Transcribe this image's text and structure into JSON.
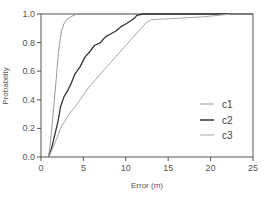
{
  "chart_data": {
    "type": "line",
    "title": "",
    "xlabel": "Error (m)",
    "ylabel": "Probability",
    "xlim": [
      0,
      25
    ],
    "ylim": [
      0,
      1.0
    ],
    "xticks": [
      "0",
      "5",
      "10",
      "15",
      "20",
      "25"
    ],
    "yticks": [
      "0.0",
      "0.2",
      "0.4",
      "0.6",
      "0.8",
      "1.0"
    ],
    "grid": false,
    "legend_position": "lower right",
    "series": [
      {
        "name": "c1",
        "color": "#9a9a9a",
        "width": 1,
        "x": [
          0.9,
          1.2,
          1.5,
          1.8,
          2.0,
          2.2,
          2.4,
          2.7,
          3.0,
          3.5,
          4.2
        ],
        "y": [
          0.0,
          0.15,
          0.35,
          0.55,
          0.7,
          0.8,
          0.88,
          0.93,
          0.96,
          0.98,
          1.0
        ]
      },
      {
        "name": "c2",
        "color": "#333333",
        "width": 1.3,
        "x": [
          0.9,
          1.2,
          1.6,
          2.0,
          2.3,
          2.7,
          3.2,
          3.6,
          4.0,
          4.6,
          5.2,
          5.8,
          6.3,
          7.0,
          7.6,
          8.2,
          8.8,
          9.4,
          10.0,
          10.5,
          11.0,
          11.3,
          12.0
        ],
        "y": [
          0.0,
          0.05,
          0.15,
          0.25,
          0.35,
          0.42,
          0.47,
          0.52,
          0.58,
          0.63,
          0.7,
          0.74,
          0.78,
          0.8,
          0.84,
          0.86,
          0.88,
          0.91,
          0.93,
          0.95,
          0.97,
          0.99,
          1.0
        ]
      },
      {
        "name": "c3",
        "color": "#a8a8a8",
        "width": 1,
        "x": [
          0.9,
          1.3,
          1.8,
          2.3,
          2.8,
          3.3,
          4.0,
          4.6,
          5.2,
          5.8,
          6.4,
          7.0,
          7.6,
          8.2,
          8.8,
          9.4,
          10.0,
          10.6,
          11.2,
          11.8,
          12.4,
          13.0,
          16.0,
          19.0,
          22.5
        ],
        "y": [
          0.0,
          0.05,
          0.12,
          0.2,
          0.25,
          0.3,
          0.35,
          0.4,
          0.45,
          0.5,
          0.54,
          0.58,
          0.62,
          0.66,
          0.7,
          0.74,
          0.78,
          0.82,
          0.86,
          0.9,
          0.94,
          0.96,
          0.97,
          0.98,
          1.0
        ]
      }
    ],
    "legend": [
      {
        "label": "c1",
        "color": "#9a9a9a"
      },
      {
        "label": "c2",
        "color": "#333333"
      },
      {
        "label": "c3",
        "color": "#a8a8a8"
      }
    ]
  }
}
